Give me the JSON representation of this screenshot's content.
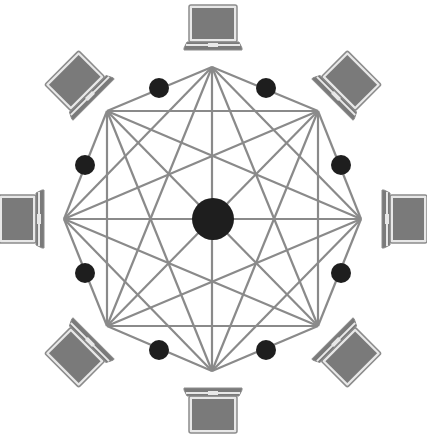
{
  "diagram": {
    "type": "mesh-network",
    "center": {
      "x": 213,
      "y": 219
    },
    "hub": {
      "label": "",
      "radius": 21
    },
    "octagon_vertices": [
      {
        "x": 212,
        "y": 67
      },
      {
        "x": 318,
        "y": 111
      },
      {
        "x": 361,
        "y": 219
      },
      {
        "x": 318,
        "y": 326
      },
      {
        "x": 212,
        "y": 371
      },
      {
        "x": 107,
        "y": 326
      },
      {
        "x": 64,
        "y": 219
      },
      {
        "x": 107,
        "y": 111
      }
    ],
    "edge_nodes": [
      {
        "x": 159,
        "y": 88
      },
      {
        "x": 266,
        "y": 88
      },
      {
        "x": 341,
        "y": 165
      },
      {
        "x": 341,
        "y": 273
      },
      {
        "x": 266,
        "y": 350
      },
      {
        "x": 159,
        "y": 350
      },
      {
        "x": 85,
        "y": 273
      },
      {
        "x": 85,
        "y": 165
      }
    ],
    "edge_node_radius": 10,
    "laptops": [
      {
        "name": "laptop-top",
        "angle": 0
      },
      {
        "name": "laptop-top-right",
        "angle": 45
      },
      {
        "name": "laptop-right",
        "angle": 90
      },
      {
        "name": "laptop-bottom-right",
        "angle": 135
      },
      {
        "name": "laptop-bottom",
        "angle": 180
      },
      {
        "name": "laptop-bottom-left",
        "angle": 225
      },
      {
        "name": "laptop-left",
        "angle": 270
      },
      {
        "name": "laptop-top-left",
        "angle": 315
      }
    ],
    "laptop_distance": 191,
    "colors": {
      "background": "#ffffff",
      "links": "#8a8a8a",
      "nodes": "#1e1e1e",
      "laptop_fill": "#7a7a7a",
      "laptop_outline": "#8c8c8c",
      "laptop_frame": "#e8e8e8"
    }
  }
}
